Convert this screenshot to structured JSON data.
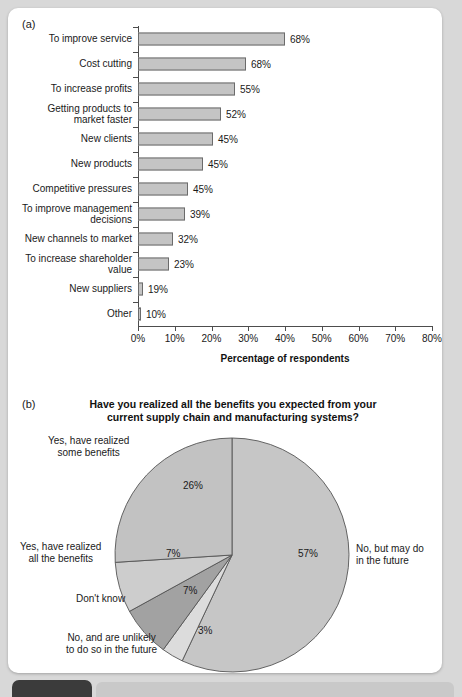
{
  "panel_a": {
    "letter": "(a)",
    "axis_title": "Percentage of respondents",
    "x_ticks": [
      "0%",
      "10%",
      "20%",
      "30%",
      "40%",
      "50%",
      "60%",
      "70%",
      "80%"
    ],
    "x_min": 0,
    "x_max": 80
  },
  "panel_b": {
    "letter": "(b)",
    "title_line1": "Have you realized all the benefits you expected from your",
    "title_line2": "current supply chain and manufacturing systems?"
  },
  "chart_data": [
    {
      "type": "bar",
      "orientation": "horizontal",
      "title": "",
      "xlabel": "Percentage of respondents",
      "ylabel": "",
      "xlim": [
        0,
        80
      ],
      "grid": false,
      "legend": "none",
      "categories": [
        "To improve service",
        "Cost cutting",
        "To increase profits",
        "Getting products to market faster",
        "New clients",
        "New products",
        "Competitive pressures",
        "To improve management decisions",
        "New channels to market",
        "To increase shareholder value",
        "New suppliers",
        "Other"
      ],
      "category_lines": [
        [
          "To improve service"
        ],
        [
          "Cost cutting"
        ],
        [
          "To increase profits"
        ],
        [
          "Getting products to",
          "market faster"
        ],
        [
          "New clients"
        ],
        [
          "New products"
        ],
        [
          "Competitive pressures"
        ],
        [
          "To improve management",
          "decisions"
        ],
        [
          "New channels to market"
        ],
        [
          "To increase shareholder",
          "value"
        ],
        [
          "New suppliers"
        ],
        [
          "Other"
        ]
      ],
      "values": [
        68,
        68,
        55,
        52,
        45,
        45,
        45,
        39,
        32,
        23,
        19,
        10
      ],
      "value_labels": [
        "68%",
        "68%",
        "55%",
        "52%",
        "45%",
        "45%",
        "45%",
        "39%",
        "32%",
        "23%",
        "19%",
        "10%"
      ],
      "drawn_bar_px": [
        147,
        108,
        97,
        83,
        75,
        65,
        50,
        47,
        35,
        31,
        5,
        3
      ],
      "bar_fill_color": "#c4c4c4",
      "bar_edge_color": "#6b6b6b"
    },
    {
      "type": "pie",
      "title": "Have you realized all the benefits you expected from your current supply chain and manufacturing systems?",
      "labels": [
        "No, but may do in the future",
        "No, and are unlikely to do so in the future",
        "Don't know",
        "Yes, have realized all the benefits",
        "Yes, have realized some benefits"
      ],
      "label_lines": [
        [
          "No, but may do",
          "in the future"
        ],
        [
          "No, and are unlikely",
          "to do so in the future"
        ],
        [
          "Don't know"
        ],
        [
          "Yes, have realized",
          "all the benefits"
        ],
        [
          "Yes, have realized",
          "some benefits"
        ]
      ],
      "values": [
        57,
        3,
        7,
        7,
        26
      ],
      "value_labels": [
        "57%",
        "3%",
        "7%",
        "7%",
        "26%"
      ],
      "colors": [
        "#c6c6c6",
        "#dcdcdc",
        "#a2a2a2",
        "#cdcdcd",
        "#c2c2c2"
      ],
      "start_angle_deg": 0,
      "direction": "clockwise"
    }
  ]
}
